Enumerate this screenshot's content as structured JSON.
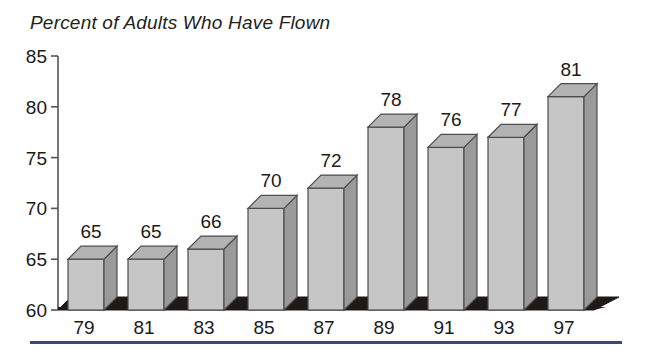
{
  "chart_data": {
    "type": "bar",
    "title": "Percent of Adults Who Have Flown",
    "subtitle": "",
    "xlabel": "",
    "ylabel": "",
    "categories": [
      "79",
      "81",
      "83",
      "85",
      "87",
      "89",
      "91",
      "93",
      "97"
    ],
    "values": [
      65,
      65,
      66,
      70,
      72,
      78,
      76,
      77,
      81
    ],
    "data_labels": [
      "65",
      "65",
      "66",
      "70",
      "72",
      "78",
      "76",
      "77",
      "81"
    ],
    "ylim": [
      60,
      85
    ],
    "yticks": [
      60,
      65,
      70,
      75,
      80,
      85
    ],
    "ytick_labels": [
      "60",
      "65",
      "70",
      "75",
      "80",
      "85"
    ],
    "grid": false,
    "legend": null,
    "legend_position": "none",
    "style": "3d-bar",
    "colors": {
      "bar_front": "#c6c6c6",
      "bar_side": "#9a9a9a",
      "bar_top": "#b3b3b3",
      "bar_outline": "#4d4d4d",
      "floor": "#1f1a18",
      "axis": "#555555",
      "text": "#1a1a1a",
      "background": "#ffffff",
      "rule": "#3b4a72"
    }
  },
  "figure": {
    "title": "Percent of Adults Who Have Flown"
  }
}
